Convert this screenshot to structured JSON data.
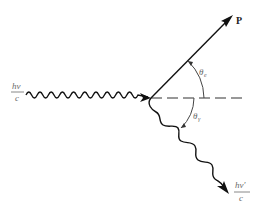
{
  "diagram": {
    "type": "compton-scattering",
    "incoming_photon": {
      "label_numerator": "hν",
      "label_denominator": "c"
    },
    "scattered_photon": {
      "label_numerator": "hν′",
      "label_denominator": "c"
    },
    "electron": {
      "label": "P"
    },
    "angles": {
      "electron_angle": "θ",
      "electron_angle_sub": "e",
      "photon_angle": "θ",
      "photon_angle_sub": "γ"
    },
    "colors": {
      "line": "#111111",
      "label": "#6a6a6a"
    }
  }
}
